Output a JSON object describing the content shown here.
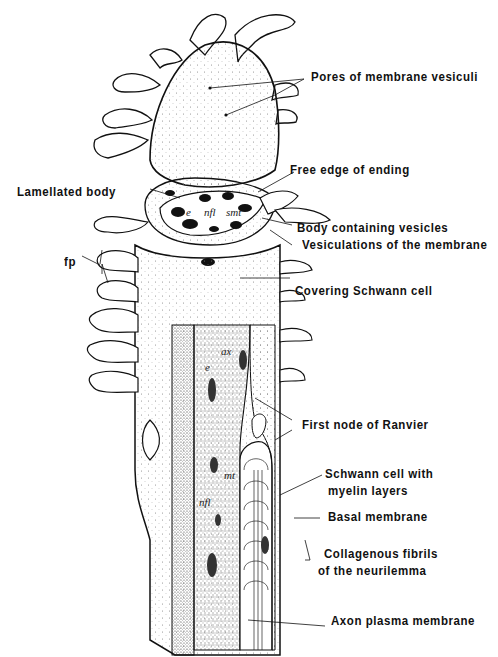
{
  "figure": {
    "type": "anatomical-illustration",
    "colors": {
      "ink": "#111111",
      "paper": "#ffffff",
      "stipple": "#555555"
    }
  },
  "labels": [
    {
      "id": "pores",
      "text": "Pores of membrane vesiculi"
    },
    {
      "id": "free_edge",
      "text": "Free edge of ending"
    },
    {
      "id": "lamellated",
      "text": "Lamellated body"
    },
    {
      "id": "body_vesicles",
      "text": "Body containing vesicles"
    },
    {
      "id": "vesiculations",
      "text": "Vesiculations of the membrane"
    },
    {
      "id": "fp",
      "text": "fp"
    },
    {
      "id": "covering_schwann",
      "text": "Covering Schwann cell"
    },
    {
      "id": "first_node",
      "text": "First node of Ranvier"
    },
    {
      "id": "schwann_myelin_1",
      "text": "Schwann cell with"
    },
    {
      "id": "schwann_myelin_2",
      "text": "myelin layers"
    },
    {
      "id": "basal",
      "text": "Basal membrane"
    },
    {
      "id": "collagen_1",
      "text": "Collagenous fibrils"
    },
    {
      "id": "collagen_2",
      "text": "of the neurilemma"
    },
    {
      "id": "axon_plasma",
      "text": "Axon plasma membrane"
    }
  ],
  "inline_abbreviations": [
    {
      "id": "e_top",
      "text": "e"
    },
    {
      "id": "nfl_top",
      "text": "nfl"
    },
    {
      "id": "smt",
      "text": "smt"
    },
    {
      "id": "ax",
      "text": "ax"
    },
    {
      "id": "e_mid",
      "text": "e"
    },
    {
      "id": "mt",
      "text": "mt"
    },
    {
      "id": "nfl_bottom",
      "text": "nfl"
    }
  ]
}
